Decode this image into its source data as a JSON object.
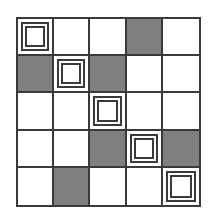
{
  "grid": {
    "rows": 5,
    "cols": 5,
    "colors": {
      "gray": "#7f7f7f",
      "white": "#ffffff",
      "line": "#3a3a3a"
    },
    "cells": [
      [
        "target",
        "white",
        "white",
        "gray",
        "white"
      ],
      [
        "gray",
        "target",
        "gray",
        "white",
        "white"
      ],
      [
        "white",
        "white",
        "target",
        "white",
        "white"
      ],
      [
        "white",
        "white",
        "gray",
        "target",
        "gray"
      ],
      [
        "white",
        "gray",
        "white",
        "white",
        "target"
      ]
    ]
  }
}
